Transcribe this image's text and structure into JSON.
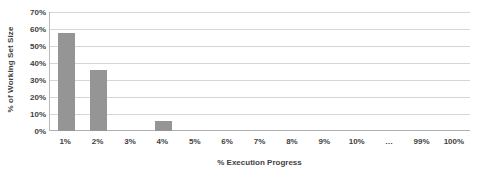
{
  "chart_data": {
    "type": "bar",
    "title": "",
    "xlabel": "% Execution Progress",
    "ylabel": "% of Working Set Size",
    "categories": [
      "1%",
      "2%",
      "3%",
      "4%",
      "5%",
      "6%",
      "7%",
      "8%",
      "9%",
      "10%",
      "…",
      "99%",
      "100%"
    ],
    "values": [
      57.5,
      36,
      0,
      6,
      0,
      0,
      0,
      0,
      0,
      0,
      0,
      0,
      0
    ],
    "series": [
      {
        "name": "% of Working Set Size",
        "values": [
          57.5,
          36,
          0,
          6,
          0,
          0,
          0,
          0,
          0,
          0,
          0,
          0,
          0
        ]
      }
    ],
    "ylim": [
      0,
      70
    ],
    "ytick_labels": [
      "0%",
      "10%",
      "20%",
      "30%",
      "40%",
      "50%",
      "60%",
      "70%"
    ],
    "ytick_values": [
      0,
      10,
      20,
      30,
      40,
      50,
      60,
      70
    ],
    "grid": true,
    "legend": false,
    "legend_position": "none",
    "bar_color": "#959595",
    "gridline_color": "#d6d6d6",
    "axis_color": "#b8b8b8",
    "text_color": "#3f3f3f",
    "background_color": "#ffffff"
  }
}
